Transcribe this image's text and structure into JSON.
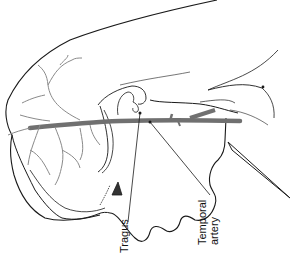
{
  "figure": {
    "labels": {
      "tragus": "Tragus",
      "temporal_line1": "Temporal",
      "temporal_line2": "artery"
    },
    "colors": {
      "outline": "#1a1a1a",
      "vessel": "#707070",
      "thin_vessel": "#8a8a8a",
      "background": "#ffffff"
    }
  }
}
